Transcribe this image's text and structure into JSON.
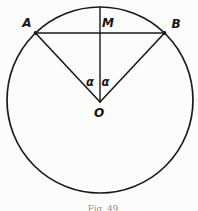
{
  "figure": {
    "caption": "Fig. 49",
    "points": {
      "a": "A",
      "b": "B",
      "m": "M",
      "o": "O"
    },
    "angles": {
      "left": "α",
      "right": "α"
    },
    "colors": {
      "ink": "#1a1a1a",
      "background": "#fcfcfb",
      "caption_ink": "#8f8f8f"
    }
  }
}
